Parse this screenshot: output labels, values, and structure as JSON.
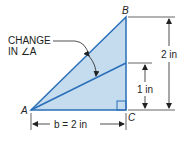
{
  "diagram": {
    "vertices": {
      "A": "A",
      "B": "B",
      "C": "C"
    },
    "annotation": {
      "line1": "CHANGE",
      "line2": "IN ∠A"
    },
    "dimensions": {
      "base": "b = 2 in",
      "height_full": "2 in",
      "height_half": "1 in"
    },
    "colors": {
      "fill": "#c5dcef",
      "stroke": "#2a6fb8",
      "dim": "#222222"
    }
  }
}
